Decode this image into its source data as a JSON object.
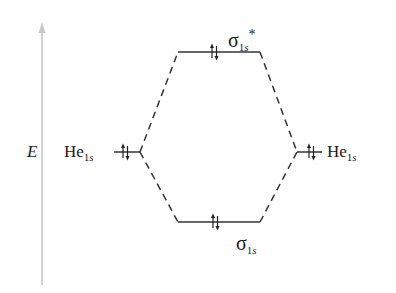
{
  "diagram": {
    "type": "molecular-orbital-energy-diagram",
    "axis": {
      "label": "E",
      "direction": "up",
      "color": "#c8c8c8"
    },
    "colors": {
      "line": "#333333",
      "text": "#1a1a1a",
      "axis": "#c8c8c8"
    },
    "atomic_orbitals": [
      {
        "id": "left",
        "element": "He",
        "orbital": "1s",
        "electrons": "↑↓",
        "side": "left"
      },
      {
        "id": "right",
        "element": "He",
        "orbital": "1s",
        "electrons": "↑↓",
        "side": "right"
      }
    ],
    "molecular_orbitals": [
      {
        "id": "antibonding",
        "symbol": "σ",
        "orbital": "1s",
        "star": "*",
        "electrons": "↑↓",
        "position": "top"
      },
      {
        "id": "bonding",
        "symbol": "σ",
        "orbital": "1s",
        "star": "",
        "electrons": "↑↓",
        "position": "bottom"
      }
    ],
    "labels": {
      "left_he": {
        "main": "He",
        "sub_num": "1",
        "sub_letter": "s"
      },
      "right_he": {
        "main": "He",
        "sub_num": "1",
        "sub_letter": "s"
      },
      "sigma_star": {
        "main": "σ",
        "sub_num": "1",
        "sub_letter": "s",
        "star": "*"
      },
      "sigma": {
        "main": "σ",
        "sub_num": "1",
        "sub_letter": "s"
      }
    }
  }
}
